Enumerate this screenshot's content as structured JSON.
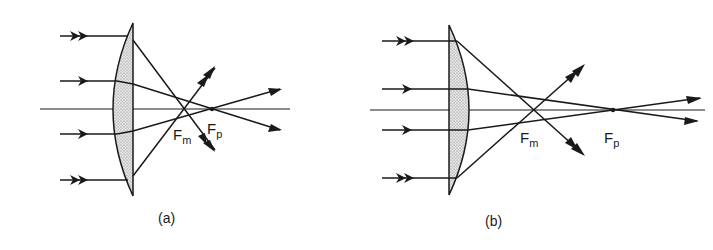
{
  "diagram": {
    "type": "optics-ray-diagram",
    "panels": [
      {
        "id": "a",
        "caption": "(a)",
        "lens_orientation": "curved side facing incoming light",
        "focal_points": [
          {
            "label": "F",
            "subscript": "m",
            "meaning": "marginal ray focus"
          },
          {
            "label": "F",
            "subscript": "p",
            "meaning": "paraxial ray focus"
          }
        ],
        "incoming_rays": 4
      },
      {
        "id": "b",
        "caption": "(b)",
        "lens_orientation": "flat side facing incoming light",
        "focal_points": [
          {
            "label": "F",
            "subscript": "m",
            "meaning": "marginal ray focus"
          },
          {
            "label": "F",
            "subscript": "p",
            "meaning": "paraxial ray focus"
          }
        ],
        "incoming_rays": 4
      }
    ],
    "colors": {
      "line": "#1a1a1a",
      "lens_fill": "#cfcfcf",
      "background": "#ffffff"
    }
  }
}
